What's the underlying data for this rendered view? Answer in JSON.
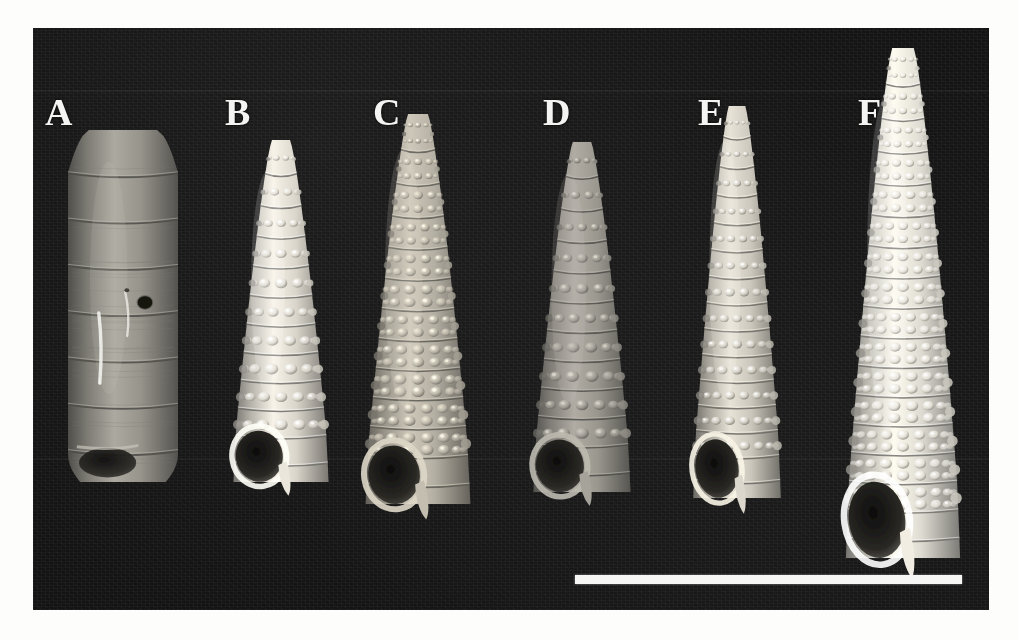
{
  "figure": {
    "kind": "scientific-plate-photograph",
    "background_color": "#131313",
    "plate": {
      "x": 33,
      "y": 28,
      "width": 956,
      "height": 582
    },
    "label_color": "#f4f4f2"
  },
  "panels": [
    {
      "label": "A",
      "label_x": 12,
      "label_y": 65,
      "description": "broad cylindrical shell, smooth with flat spiral bands, one dark circular boring hole",
      "shell": {
        "x": 35,
        "y": 102,
        "w": 110,
        "h": 352
      },
      "tone": "#9a978f",
      "style": "smooth-banded",
      "whorls": 7,
      "beads_per_row": 0,
      "has_aperture": true,
      "has_borehole": true
    },
    {
      "label": "B",
      "label_x": 192,
      "label_y": 65,
      "description": "pale cream conical shell with low rounded beads, blunt apex",
      "shell": {
        "x": 198,
        "y": 112,
        "w": 100,
        "h": 342
      },
      "tone": "#ddd9cf",
      "style": "beaded",
      "whorls": 11,
      "beads_per_row": 7,
      "has_aperture": true,
      "has_borehole": false
    },
    {
      "label": "C",
      "label_x": 340,
      "label_y": 65,
      "description": "coarsely granulate conical shell with open aperture and short siphonal canal",
      "shell": {
        "x": 330,
        "y": 86,
        "w": 110,
        "h": 390
      },
      "tone": "#b8b3a6",
      "style": "granulate",
      "whorls": 12,
      "beads_per_row": 8,
      "has_aperture": true,
      "has_borehole": false
    },
    {
      "label": "D",
      "label_x": 510,
      "label_y": 65,
      "description": "grey-brown shell with strong tubercles, aperture visible at base",
      "shell": {
        "x": 498,
        "y": 114,
        "w": 102,
        "h": 350
      },
      "tone": "#9d9a92",
      "style": "tuberculate",
      "whorls": 11,
      "beads_per_row": 7,
      "has_aperture": true,
      "has_borehole": false
    },
    {
      "label": "E",
      "label_x": 665,
      "label_y": 65,
      "description": "slender pale turriform shell with fine even beading, narrow aperture",
      "shell": {
        "x": 658,
        "y": 78,
        "w": 92,
        "h": 392
      },
      "tone": "#cfcbc0",
      "style": "finely-beaded",
      "whorls": 14,
      "beads_per_row": 8,
      "has_aperture": true,
      "has_borehole": false
    },
    {
      "label": "F",
      "label_x": 825,
      "label_y": 65,
      "description": "largest, tall whitish shell with strong spiral cords and a broad rounded aperture",
      "shell": {
        "x": 810,
        "y": 20,
        "w": 120,
        "h": 510
      },
      "tone": "#e3e0d6",
      "style": "corded-beaded",
      "whorls": 16,
      "beads_per_row": 9,
      "has_aperture": true,
      "has_borehole": false
    }
  ],
  "scale_bar": {
    "x": 542,
    "y": 547,
    "width": 387,
    "height": 9,
    "color": "#f6f6f4",
    "caption": ""
  }
}
